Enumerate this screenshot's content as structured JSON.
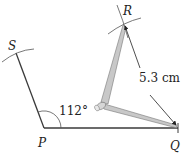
{
  "diagram": {
    "type": "geometric-construction",
    "points": {
      "P": {
        "label": "P",
        "x": 44,
        "y": 128
      },
      "Q": {
        "label": "Q",
        "x": 178,
        "y": 128
      },
      "S": {
        "label": "S",
        "x": 16,
        "y": 53
      },
      "R": {
        "label": "R",
        "x": 124,
        "y": 23
      }
    },
    "angle_label": "112°",
    "length_label": "5.3 cm",
    "colors": {
      "line": "#3a3a3a",
      "compass": "#c8c8c8",
      "compass_edge": "#777777"
    }
  }
}
